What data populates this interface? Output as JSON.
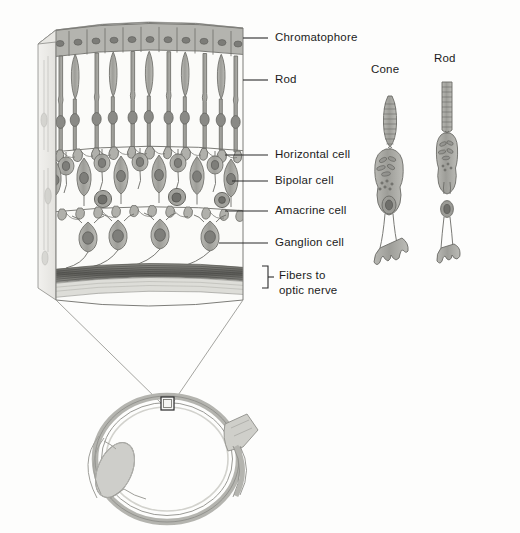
{
  "figure": {
    "background_color": "#fdfdfc",
    "ink_color": "#3a3a3a",
    "cell_fill": "#a9a9a4",
    "cell_fill_light": "#c9c9c4",
    "nucleus_color": "#8a8a86",
    "fiber_band_color": "#6f6f6b"
  },
  "labels": {
    "chromatophore": "Chromatophore",
    "rod": "Rod",
    "horizontal_cell": "Horizontal cell",
    "bipolar_cell": "Bipolar cell",
    "amacrine_cell": "Amacrine cell",
    "ganglion_cell": "Ganglion cell",
    "fibers_line1": "Fibers to",
    "fibers_line2": "optic nerve"
  },
  "photoreceptor_panel": {
    "cone_label": "Cone",
    "rod_label": "Rod"
  },
  "eye_diagram": {
    "callout_box_label": "",
    "parts": [
      "sclera",
      "lens",
      "cornea",
      "optic nerve"
    ]
  },
  "layers": [
    {
      "name": "chromatophore",
      "order": 1
    },
    {
      "name": "rod-and-cone",
      "order": 2
    },
    {
      "name": "outer-plexiform",
      "order": 3
    },
    {
      "name": "horizontal-cell",
      "order": 4
    },
    {
      "name": "bipolar-cell",
      "order": 5
    },
    {
      "name": "amacrine-cell",
      "order": 6
    },
    {
      "name": "inner-plexiform",
      "order": 7
    },
    {
      "name": "ganglion-cell",
      "order": 8
    },
    {
      "name": "nerve-fiber",
      "order": 9
    }
  ]
}
